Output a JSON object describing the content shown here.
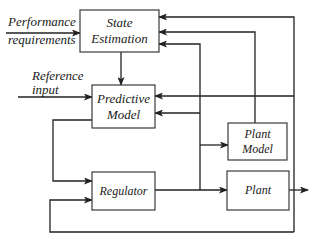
{
  "diagram": {
    "blocks": {
      "state_estimation": {
        "line1": "State",
        "line2": "Estimation"
      },
      "predictive_model": {
        "line1": "Predictive",
        "line2": "Model"
      },
      "regulator": {
        "label": "Regulator"
      },
      "plant_model": {
        "line1": "Plant",
        "line2": "Model"
      },
      "plant": {
        "label": "Plant"
      }
    },
    "inputs": {
      "performance": {
        "line1": "Performance",
        "line2": "requirements"
      },
      "reference": {
        "line1": "Reference",
        "line2": "input"
      }
    },
    "colors": {
      "stroke": "#222222",
      "box_border": "#3a3a3a",
      "background": "#ffffff",
      "text": "#1a1a1a"
    }
  }
}
